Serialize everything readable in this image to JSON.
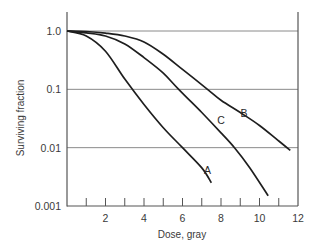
{
  "chart_data": {
    "type": "line",
    "title": "",
    "xlabel": "Dose, gray",
    "ylabel": "Surviving fraction",
    "xlim": [
      0,
      12
    ],
    "ylim": [
      0.001,
      1.0
    ],
    "yscale": "log",
    "grid": "horizontal lines at each decade",
    "legend": "inline curve labels",
    "x_ticks": [
      1,
      2,
      3,
      4,
      5,
      6,
      7,
      8,
      9,
      10,
      11,
      12
    ],
    "x_tick_labels": [
      "2",
      "4",
      "6",
      "8",
      "10",
      "12"
    ],
    "x_tick_label_values": [
      2,
      4,
      6,
      8,
      10,
      12
    ],
    "y_tick_labels": [
      "1.0",
      "0.1",
      "0.01",
      "0.001"
    ],
    "y_tick_values": [
      1.0,
      0.1,
      0.01,
      0.001
    ],
    "series": [
      {
        "name": "A",
        "points": [
          [
            0,
            1.0
          ],
          [
            1,
            0.82
          ],
          [
            2,
            0.45
          ],
          [
            3,
            0.15
          ],
          [
            4,
            0.055
          ],
          [
            5,
            0.022
          ],
          [
            6,
            0.01
          ],
          [
            7,
            0.0045
          ],
          [
            7.5,
            0.0025
          ]
        ]
      },
      {
        "name": "B",
        "points": [
          [
            0,
            1.0
          ],
          [
            1,
            0.98
          ],
          [
            2,
            0.92
          ],
          [
            3,
            0.82
          ],
          [
            4,
            0.65
          ],
          [
            5,
            0.4
          ],
          [
            6,
            0.22
          ],
          [
            7.3,
            0.1
          ],
          [
            8,
            0.065
          ],
          [
            9,
            0.04
          ],
          [
            10,
            0.024
          ],
          [
            11,
            0.013
          ],
          [
            11.6,
            0.009
          ]
        ]
      },
      {
        "name": "C",
        "points": [
          [
            0,
            1.0
          ],
          [
            1,
            0.93
          ],
          [
            2,
            0.82
          ],
          [
            3,
            0.6
          ],
          [
            4,
            0.35
          ],
          [
            5,
            0.19
          ],
          [
            5.8,
            0.1
          ],
          [
            7,
            0.04
          ],
          [
            8,
            0.018
          ],
          [
            8.7,
            0.01
          ],
          [
            9.5,
            0.0045
          ],
          [
            10.45,
            0.0015
          ]
        ]
      }
    ],
    "curve_label_positions": {
      "A": {
        "x": 7.3,
        "y": 0.0036
      },
      "B": {
        "x": 9.2,
        "y": 0.033
      },
      "C": {
        "x": 8.0,
        "y": 0.025
      }
    }
  }
}
